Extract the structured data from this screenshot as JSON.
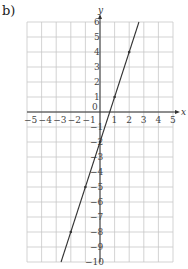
{
  "part_label": "b)",
  "chart_data": {
    "type": "line",
    "title": "",
    "xlabel": "x",
    "ylabel": "y",
    "xlim": [
      -5,
      5
    ],
    "ylim": [
      -10,
      6
    ],
    "grid": true,
    "x_ticks": [
      -5,
      -4,
      -3,
      -2,
      -1,
      0,
      1,
      2,
      3,
      4,
      5
    ],
    "y_ticks": [
      6,
      5,
      4,
      3,
      2,
      1,
      -1,
      -2,
      -3,
      -4,
      -5,
      -6,
      -7,
      -8,
      -9,
      -10
    ],
    "series": [
      {
        "name": "y = 3x - 2",
        "equation": "y = 3x - 2",
        "x": [
          -2.667,
          2.667
        ],
        "y": [
          -10,
          6
        ],
        "marked_points": [
          [
            -2,
            -8
          ],
          [
            -1,
            -5
          ],
          [
            0,
            -2
          ],
          [
            1,
            1
          ],
          [
            2,
            4
          ]
        ]
      }
    ],
    "colors": {
      "grid": "#c8c8c8",
      "axis": "#333333",
      "line": "#333333"
    }
  }
}
